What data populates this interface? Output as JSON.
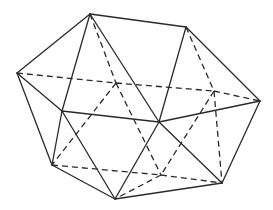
{
  "figure": {
    "shape": "icosahedron",
    "line_color": "#2a2a2a",
    "background": "#ffffff",
    "vertices": {
      "A": [
        90,
        14
      ],
      "B": [
        186,
        27
      ],
      "C": [
        17,
        73
      ],
      "D": [
        260,
        101
      ],
      "E": [
        62,
        111
      ],
      "F": [
        159,
        122
      ],
      "G": [
        52,
        165
      ],
      "H": [
        115,
        199
      ],
      "I": [
        222,
        183
      ],
      "J": [
        116,
        83
      ],
      "K": [
        214,
        91
      ],
      "L": [
        161,
        175
      ]
    },
    "visible_edges": [
      [
        "A",
        "B"
      ],
      [
        "A",
        "C"
      ],
      [
        "A",
        "E"
      ],
      [
        "A",
        "F"
      ],
      [
        "B",
        "F"
      ],
      [
        "B",
        "D"
      ],
      [
        "C",
        "E"
      ],
      [
        "C",
        "G"
      ],
      [
        "E",
        "F"
      ],
      [
        "E",
        "G"
      ],
      [
        "E",
        "H"
      ],
      [
        "F",
        "D"
      ],
      [
        "F",
        "H"
      ],
      [
        "F",
        "I"
      ],
      [
        "D",
        "I"
      ],
      [
        "G",
        "H"
      ],
      [
        "H",
        "I"
      ]
    ],
    "hidden_edges": [
      [
        "A",
        "J"
      ],
      [
        "B",
        "K"
      ],
      [
        "C",
        "J"
      ],
      [
        "J",
        "K"
      ],
      [
        "K",
        "D"
      ],
      [
        "J",
        "G"
      ],
      [
        "J",
        "L"
      ],
      [
        "K",
        "L"
      ],
      [
        "K",
        "I"
      ],
      [
        "G",
        "L"
      ],
      [
        "L",
        "I"
      ],
      [
        "L",
        "H"
      ]
    ]
  }
}
